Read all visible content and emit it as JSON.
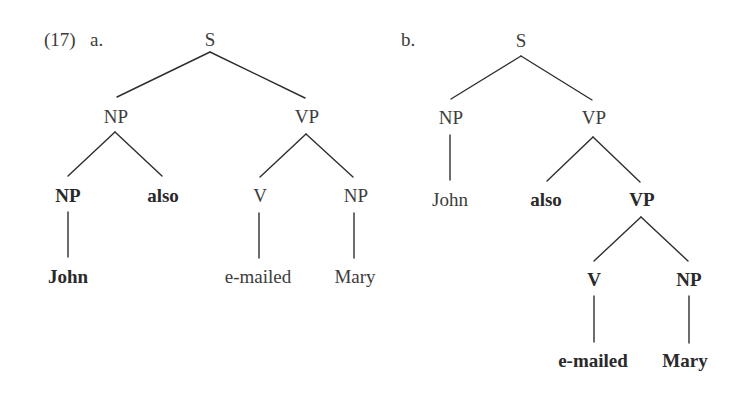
{
  "example": {
    "number": "(17)",
    "tree_a": {
      "marker": "a.",
      "nodes": {
        "S": "S",
        "NP": "NP",
        "VP": "VP",
        "NP_inner": "NP",
        "also": "also",
        "V": "V",
        "NP_obj": "NP",
        "John": "John",
        "emailed": "e-mailed",
        "Mary": "Mary"
      },
      "bold_nodes": [
        "NP_inner",
        "also",
        "John"
      ]
    },
    "tree_b": {
      "marker": "b.",
      "nodes": {
        "S": "S",
        "NP": "NP",
        "VP": "VP",
        "John": "John",
        "also": "also",
        "VP_inner": "VP",
        "V": "V",
        "NP_obj": "NP",
        "emailed": "e-mailed",
        "Mary": "Mary"
      },
      "bold_nodes": [
        "also",
        "VP_inner",
        "V",
        "NP_obj",
        "emailed",
        "Mary"
      ]
    }
  }
}
